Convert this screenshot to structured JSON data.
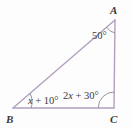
{
  "figure": {
    "type": "triangle-diagram",
    "background_color": "#fdfdfd",
    "stroke_color": "#b3a0c0",
    "text_color": "#3a3a3a"
  },
  "vertices": {
    "A": {
      "label": "A",
      "x": 115,
      "y": 20
    },
    "B": {
      "label": "B",
      "x": 13,
      "y": 108
    },
    "C": {
      "label": "C",
      "x": 114,
      "y": 108
    }
  },
  "angles": {
    "A": {
      "text": "50°",
      "value": "50",
      "unit": "°"
    },
    "B": {
      "prefix": "",
      "var": "x",
      "text": "x + 10°",
      "coefficient": "",
      "constant": "10"
    },
    "C": {
      "prefix": "2",
      "var": "x",
      "text": "2x + 30°",
      "coefficient": "2",
      "constant": "30"
    }
  },
  "sides": [
    {
      "name": "side-AB",
      "from": "A",
      "to": "B"
    },
    {
      "name": "side-BC",
      "from": "B",
      "to": "C"
    },
    {
      "name": "side-CA",
      "from": "C",
      "to": "A"
    }
  ]
}
